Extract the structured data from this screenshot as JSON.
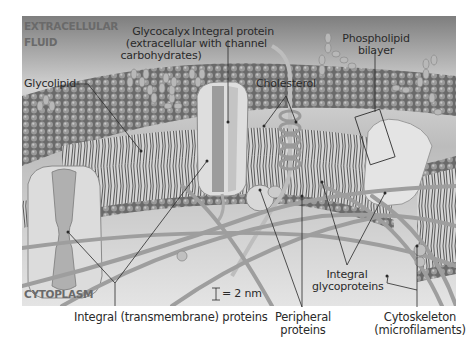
{
  "regions": {
    "extracellular": "EXTRACELLULAR FLUID",
    "extracellular_line1": "EXTRACELLULAR",
    "extracellular_line2": "FLUID",
    "cytoplasm": "CYTOPLASM"
  },
  "labels": {
    "glycocalyx_line1": "Glycocalyx",
    "glycocalyx_line2": "(extracellular",
    "glycocalyx_line3": "carbohydrates)",
    "integral_channel_line1": "Integral protein",
    "integral_channel_line2": "with channel",
    "phospholipid_line1": "Phospholipid",
    "phospholipid_line2": "bilayer",
    "glycolipid": "Glycolipid",
    "cholesterol": "Cholesterol",
    "integral_glyco_line1": "Integral",
    "integral_glyco_line2": "glycoproteins",
    "transmembrane": "Integral (transmembrane) proteins",
    "peripheral_line1": "Peripheral",
    "peripheral_line2": "proteins",
    "cytoskeleton_line1": "Cytoskeleton",
    "cytoskeleton_line2": "(microfilaments)"
  },
  "scale_bar": {
    "icon": "scale-bar-icon",
    "text": "= 2 nm"
  },
  "colors": {
    "panel_bg_top": "#8a8a8a",
    "panel_bg_bottom": "#e6e6e6",
    "membrane_heads": "#6e6e6e",
    "protein": "#d8d8d8",
    "leader_line": "#2a2a2a",
    "text": "#2a2a2a",
    "region_text": "#6a6a6a"
  }
}
